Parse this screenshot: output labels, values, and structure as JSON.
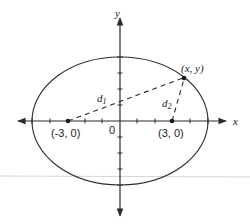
{
  "diagram": {
    "type": "ellipse-with-foci",
    "colors": {
      "stroke": "#2a2a2a",
      "background": "#ffffff",
      "artifact_line": "#cfcfcf"
    },
    "axes": {
      "x_label": "x",
      "y_label": "y",
      "origin_label": "0"
    },
    "foci": [
      {
        "label": "(-3, 0)",
        "x": -3,
        "y": 0
      },
      {
        "label": "(3, 0)",
        "x": 3,
        "y": 0
      }
    ],
    "point": {
      "label": "(x, y)"
    },
    "distances": {
      "d1": {
        "base": "d",
        "sub": "1"
      },
      "d2": {
        "base": "d",
        "sub": "2"
      }
    }
  }
}
